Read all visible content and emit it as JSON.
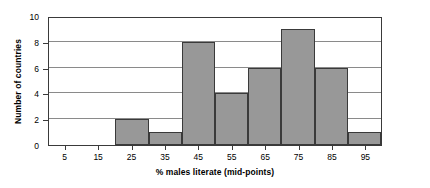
{
  "chart_data": {
    "type": "bar",
    "title": "",
    "subtitle": "",
    "xlabel": "% males literate (mid-points)",
    "ylabel": "Number of countries",
    "categories": [
      "5",
      "15",
      "25",
      "35",
      "45",
      "55",
      "65",
      "75",
      "85",
      "95"
    ],
    "values": [
      0,
      0,
      2,
      1,
      8,
      4,
      6,
      9,
      6,
      1
    ],
    "series": [
      {
        "name": "Number of countries",
        "values": [
          0,
          0,
          2,
          1,
          8,
          4,
          6,
          9,
          6,
          1
        ]
      }
    ],
    "ylim": [
      0,
      10
    ],
    "y_ticks": [
      "0",
      "2",
      "4",
      "6",
      "8",
      "10"
    ],
    "y_tick_values": [
      0,
      2,
      4,
      6,
      8,
      10
    ],
    "x_ticks": [
      "5",
      "15",
      "25",
      "35",
      "45",
      "55",
      "65",
      "75",
      "85",
      "95"
    ],
    "grid": "horizontal",
    "legend": "none",
    "bar_color": "#989898",
    "bar_border_color": "#3a3a3a",
    "gridline_color": "#8a8a8a",
    "axis_color": "#3a3a3a",
    "background_color": "#ffffff"
  }
}
